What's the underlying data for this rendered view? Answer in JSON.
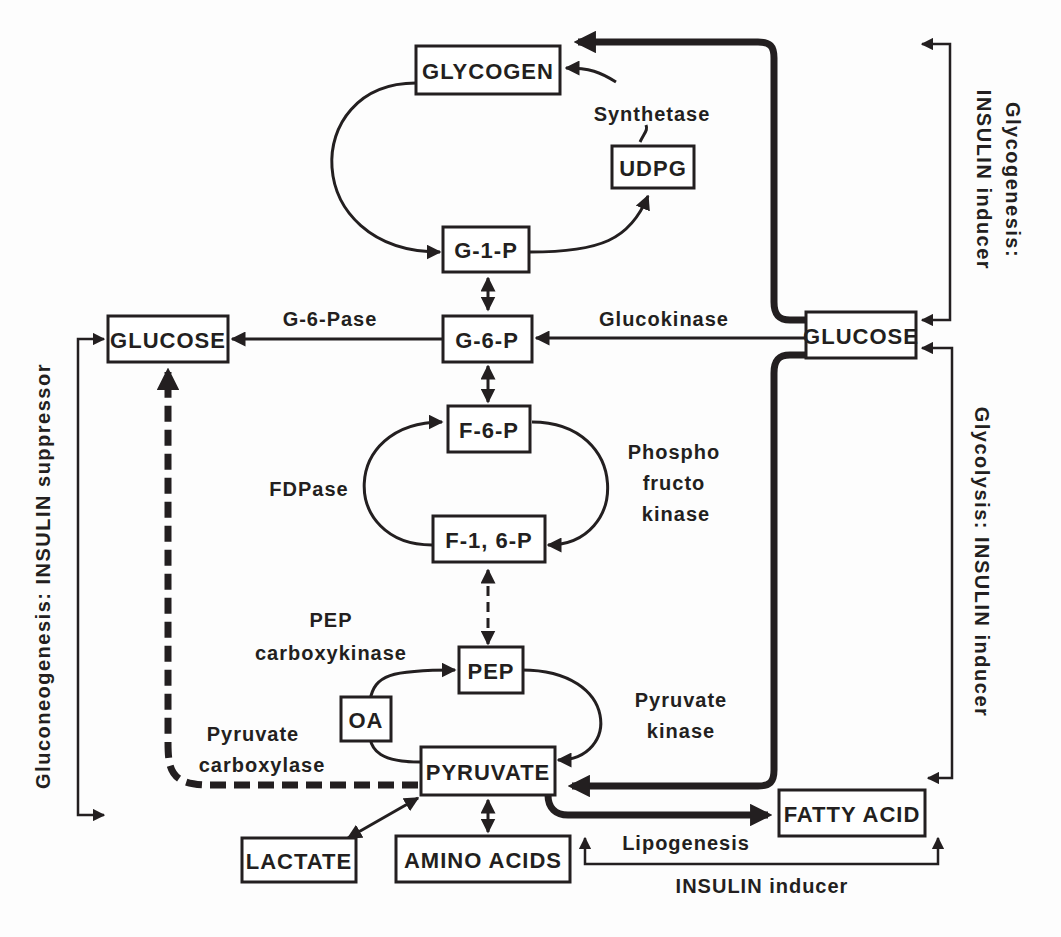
{
  "diagram": {
    "type": "metabolic-pathway",
    "colors": {
      "ink": "#231f20",
      "background": "#fdfdfd"
    },
    "nodes": {
      "glycogen": "GLYCOGEN",
      "udpg": "UDPG",
      "g1p": "G-1-P",
      "g6p": "G-6-P",
      "glucose_left": "GLUCOSE",
      "glucose_right": "GLUCOSE",
      "f6p": "F-6-P",
      "f16p": "F-1, 6-P",
      "pep": "PEP",
      "oa": "OA",
      "pyruvate": "PYRUVATE",
      "lactate": "LACTATE",
      "amino_acids": "AMINO ACIDS",
      "fatty_acid": "FATTY ACID"
    },
    "enzymes": {
      "synthetase": "Synthetase",
      "g6pase": "G-6-Pase",
      "glucokinase": "Glucokinase",
      "fdpase": "FDPase",
      "pfk_line1": "Phospho",
      "pfk_line2": "fructo",
      "pfk_line3": "kinase",
      "pepck_line1": "PEP",
      "pepck_line2": "carboxykinase",
      "pk_line1": "Pyruvate",
      "pk_line2": "kinase",
      "pc_line1": "Pyruvate",
      "pc_line2": "carboxylase",
      "lipogenesis": "Lipogenesis"
    },
    "regulation": {
      "glycogenesis_line1": "Glycogenesis:",
      "glycogenesis_line2": "INSULIN inducer",
      "glycolysis": "Glycolysis: INSULIN inducer",
      "gluconeogenesis": "Gluconeogenesis: INSULIN suppressor",
      "lipogenesis_reg": "INSULIN inducer"
    }
  }
}
